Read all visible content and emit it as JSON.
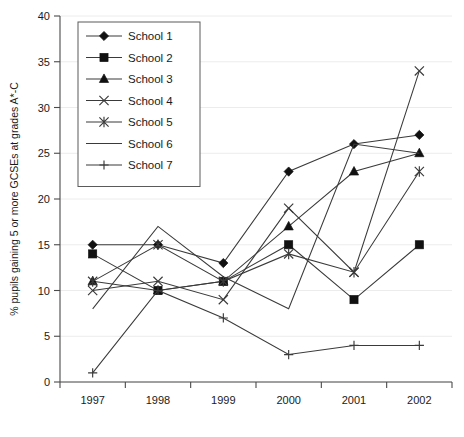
{
  "chart_data": {
    "type": "line",
    "title": "",
    "xlabel": "",
    "ylabel": "% pupils gaining 5 or more GCSEs at grades A*-C",
    "categories": [
      "1997",
      "1998",
      "1999",
      "2000",
      "2001",
      "2002"
    ],
    "x_tick_labels": [
      "1997",
      "1998",
      "1999",
      "2000",
      "2001",
      "2002"
    ],
    "y_tick_labels": [
      "0",
      "5",
      "10",
      "15",
      "20",
      "25",
      "30",
      "35",
      "40"
    ],
    "y_ticks": [
      0,
      5,
      10,
      15,
      20,
      25,
      30,
      35,
      40
    ],
    "ylim": [
      0,
      40
    ],
    "grid": "horizontal",
    "legend_position": "top-left",
    "series": [
      {
        "name": "School 1",
        "marker": "diamond",
        "values": [
          15,
          15,
          13,
          23,
          26,
          27
        ]
      },
      {
        "name": "School 2",
        "marker": "square",
        "values": [
          14,
          10,
          11,
          15,
          9,
          15
        ]
      },
      {
        "name": "School 3",
        "marker": "triangle",
        "values": [
          11,
          10,
          11,
          17,
          23,
          25
        ]
      },
      {
        "name": "School 4",
        "marker": "x",
        "values": [
          10,
          11,
          9,
          19,
          12,
          34
        ]
      },
      {
        "name": "School 5",
        "marker": "asterisk",
        "values": [
          11,
          15,
          11,
          14,
          12,
          23
        ]
      },
      {
        "name": "School 6",
        "marker": "none",
        "values": [
          8,
          17,
          11.5,
          8,
          26,
          25
        ]
      },
      {
        "name": "School 7",
        "marker": "plus",
        "values": [
          1,
          10,
          7,
          3,
          4,
          4
        ]
      }
    ]
  },
  "colors": {
    "line": "#3a3a3a",
    "marker": "#111111",
    "axis": "#4a4a4a",
    "grid": "#ececec",
    "background": "#ffffff"
  }
}
